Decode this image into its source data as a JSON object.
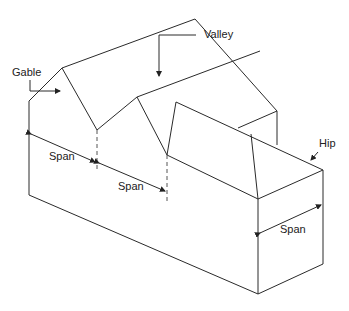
{
  "diagram": {
    "type": "isometric roof framing diagram",
    "labels": {
      "gable": "Gable",
      "valley": "Valley",
      "hip": "Hip",
      "span_left": "Span",
      "span_middle": "Span",
      "span_right": "Span"
    },
    "colors": {
      "line": "#2a2a2a",
      "background": "#ffffff"
    }
  }
}
